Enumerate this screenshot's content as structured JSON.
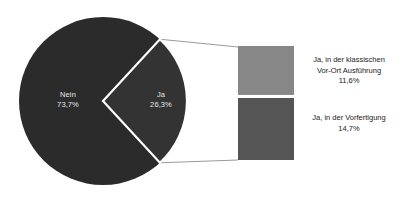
{
  "chart_data": {
    "type": "pie",
    "title": "",
    "subtitle": "",
    "xlabel": "",
    "ylabel": "",
    "legend_position": "right",
    "grid": false,
    "pie": {
      "categories": [
        "Nein",
        "Ja"
      ],
      "values": [
        73.7,
        26.3
      ],
      "value_labels": [
        "73,7%",
        "26,3%"
      ],
      "colors": [
        "#2b2b2b",
        "#333333"
      ],
      "start_angle_deg": 47.3,
      "direction": "clockwise",
      "exploded_category": "Ja"
    },
    "breakout_bar": {
      "parent_category": "Ja",
      "parent_value": 26.3,
      "categories": [
        "Ja, in der klassischen Vor-Ort Ausführung",
        "Ja, in der Vorfertigung"
      ],
      "values": [
        11.6,
        14.7
      ],
      "value_labels": [
        "11,6%",
        "14,7%"
      ],
      "colors": [
        "#878787",
        "#555555"
      ]
    }
  },
  "pie_labels": {
    "nein": {
      "name": "Nein",
      "value": "73,7%"
    },
    "ja": {
      "name": "Ja",
      "value": "26,3%"
    }
  },
  "bar_captions": {
    "klassisch": {
      "line1": "Ja, in der klassischen",
      "line2": "Vor-Ort Ausführung",
      "line3": "11,6%"
    },
    "vorfertigung": {
      "line1": "Ja, in der Vorfertigung",
      "line2": "14,7%"
    }
  },
  "colors": {
    "slice_nein": "#2b2b2b",
    "slice_ja": "#333333",
    "bar_top": "#878787",
    "bar_bottom": "#555555",
    "separator": "#ffffff",
    "connector": "#9a9a9a",
    "background": "#ffffff",
    "label_text": "#e8e8e8",
    "caption_text": "#1a1a1a"
  }
}
